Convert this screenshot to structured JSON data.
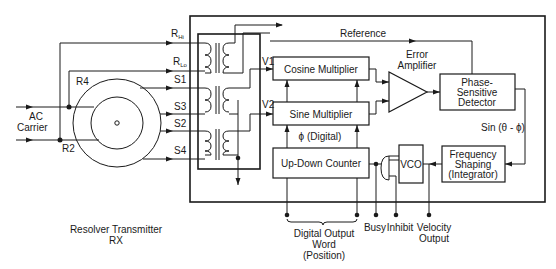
{
  "diagram": {
    "inputs": {
      "carrier_label_1": "AC",
      "carrier_label_2": "Carrier"
    },
    "resolver": {
      "label_1": "Resolver Transmitter",
      "label_2": "RX",
      "terminals": [
        "R4",
        "R2",
        "S1",
        "S3",
        "S2",
        "S4"
      ]
    },
    "reference_lines": {
      "r_hi": "R",
      "r_hi_sub": "Hi",
      "r_lo": "R",
      "r_lo_sub": "Lo"
    },
    "signals": {
      "v1": "V1",
      "v2": "V2",
      "reference": "Reference",
      "phi_digital": "ϕ (Digital)",
      "sin_error": "Sin (θ - ϕ)"
    },
    "blocks": {
      "cosine_multiplier": "Cosine Multiplier",
      "sine_multiplier": "Sine Multiplier",
      "up_down_counter": "Up-Down Counter",
      "error_amplifier_1": "Error",
      "error_amplifier_2": "Amplifier",
      "phase_detector_1": "Phase-",
      "phase_detector_2": "Sensitive",
      "phase_detector_3": "Detector",
      "freq_shaping_1": "Frequency",
      "freq_shaping_2": "Shaping",
      "freq_shaping_3": "(Integrator)",
      "vco": "VCO"
    },
    "outputs": {
      "digital_word_1": "Digital Output",
      "digital_word_2": "Word",
      "digital_word_3": "(Position)",
      "busy": "Busy",
      "inhibit": "Inhibit",
      "velocity_1": "Velocity",
      "velocity_2": "Output"
    },
    "colors": {
      "line": "#1a1a1a",
      "background": "#ffffff"
    }
  }
}
